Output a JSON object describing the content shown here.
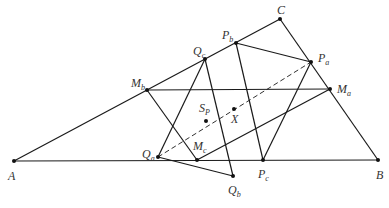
{
  "diagram": {
    "type": "geometry",
    "points": {
      "A": {
        "label": "A",
        "sub": "",
        "x": 14,
        "y": 161,
        "lx": 8,
        "ly": 180
      },
      "B": {
        "label": "B",
        "sub": "",
        "x": 378,
        "y": 160,
        "lx": 376,
        "ly": 179
      },
      "C": {
        "label": "C",
        "sub": "",
        "x": 280,
        "y": 19,
        "lx": 277,
        "ly": 14
      },
      "Pa": {
        "label": "P",
        "sub": "a",
        "x": 311,
        "y": 62,
        "lx": 318,
        "ly": 62
      },
      "Pb": {
        "label": "P",
        "sub": "b",
        "x": 236,
        "y": 43,
        "lx": 222,
        "ly": 39
      },
      "Pc": {
        "label": "P",
        "sub": "c",
        "x": 263,
        "y": 160,
        "lx": 258,
        "ly": 178
      },
      "Qa": {
        "label": "Q",
        "sub": "a",
        "x": 158,
        "y": 157,
        "lx": 142,
        "ly": 158
      },
      "Qb": {
        "label": "Q",
        "sub": "b",
        "x": 233,
        "y": 176,
        "lx": 228,
        "ly": 194
      },
      "Qc": {
        "label": "Q",
        "sub": "c",
        "x": 205,
        "y": 59,
        "lx": 193,
        "ly": 55
      },
      "Ma": {
        "label": "M",
        "sub": "a",
        "x": 330,
        "y": 89,
        "lx": 337,
        "ly": 93
      },
      "Mb": {
        "label": "M",
        "sub": "b",
        "x": 147,
        "y": 90,
        "lx": 131,
        "ly": 87
      },
      "Mc": {
        "label": "M",
        "sub": "c",
        "x": 197,
        "y": 160,
        "lx": 193,
        "ly": 150
      },
      "Sp": {
        "label": "S",
        "sub": "P",
        "x": 206,
        "y": 121,
        "lx": 199,
        "ly": 112
      },
      "X": {
        "label": "X",
        "sub": "",
        "x": 234,
        "y": 109,
        "lx": 231,
        "ly": 123
      }
    },
    "segments": [
      [
        "A",
        "B"
      ],
      [
        "B",
        "C"
      ],
      [
        "C",
        "A"
      ],
      [
        "Mb",
        "Ma"
      ],
      [
        "Pb",
        "Pa"
      ],
      [
        "Pb",
        "Pc"
      ],
      [
        "Pa",
        "Pc"
      ],
      [
        "Qc",
        "Qa"
      ],
      [
        "Qc",
        "Qb"
      ],
      [
        "Qa",
        "Qb"
      ],
      [
        "Mb",
        "Mc"
      ],
      [
        "Mc",
        "Ma"
      ]
    ],
    "dashed_segments": [
      [
        "Qa",
        "Pa"
      ]
    ]
  }
}
